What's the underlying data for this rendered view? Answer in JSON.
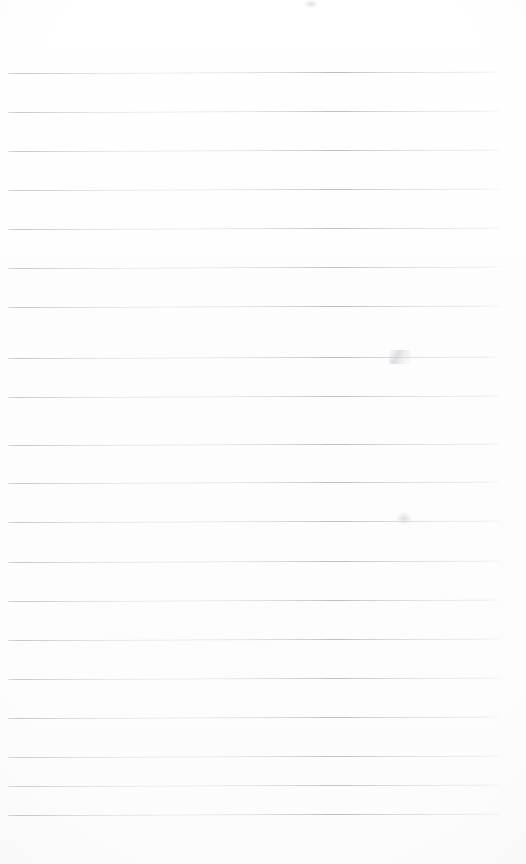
{
  "document": {
    "kind": "lined-notepad-page",
    "title": "Blank ruled notebook page",
    "page_width": 526,
    "page_height": 864,
    "background_color": "#fdfdfd",
    "content_text": "",
    "has_handwriting": false,
    "has_printed_text": false
  },
  "ruling": {
    "line_color": "#b9bbbe",
    "line_thickness_px": 1,
    "line_count": 20,
    "line_spacing_px": 39,
    "first_line_y": 73,
    "last_line_y": 815,
    "left_margin_x": 8,
    "right_margin_x": 500,
    "line_width_px": 492,
    "skew_degrees": -0.18,
    "lines": [
      {
        "index": 1,
        "y": 73,
        "x1": 8,
        "x2": 500,
        "opacity": 0.95
      },
      {
        "index": 2,
        "y": 112,
        "x1": 8,
        "x2": 500,
        "opacity": 0.9
      },
      {
        "index": 3,
        "y": 151,
        "x1": 8,
        "x2": 500,
        "opacity": 0.92
      },
      {
        "index": 4,
        "y": 190,
        "x1": 8,
        "x2": 500,
        "opacity": 0.88
      },
      {
        "index": 5,
        "y": 229,
        "x1": 8,
        "x2": 500,
        "opacity": 0.93
      },
      {
        "index": 6,
        "y": 268,
        "x1": 8,
        "x2": 500,
        "opacity": 0.9
      },
      {
        "index": 7,
        "y": 307,
        "x1": 8,
        "x2": 500,
        "opacity": 0.95
      },
      {
        "index": 8,
        "y": 358,
        "x1": 8,
        "x2": 500,
        "opacity": 0.92
      },
      {
        "index": 9,
        "y": 397,
        "x1": 8,
        "x2": 500,
        "opacity": 0.88
      },
      {
        "index": 10,
        "y": 445,
        "x1": 8,
        "x2": 500,
        "opacity": 0.94
      },
      {
        "index": 11,
        "y": 483,
        "x1": 8,
        "x2": 500,
        "opacity": 0.91
      },
      {
        "index": 12,
        "y": 522,
        "x1": 8,
        "x2": 500,
        "opacity": 0.89
      },
      {
        "index": 13,
        "y": 562,
        "x1": 8,
        "x2": 500,
        "opacity": 0.93
      },
      {
        "index": 14,
        "y": 601,
        "x1": 8,
        "x2": 500,
        "opacity": 0.9
      },
      {
        "index": 15,
        "y": 640,
        "x1": 8,
        "x2": 500,
        "opacity": 0.92
      },
      {
        "index": 16,
        "y": 679,
        "x1": 8,
        "x2": 500,
        "opacity": 0.88
      },
      {
        "index": 17,
        "y": 718,
        "x1": 8,
        "x2": 500,
        "opacity": 0.91
      },
      {
        "index": 18,
        "y": 757,
        "x1": 8,
        "x2": 500,
        "opacity": 0.86
      },
      {
        "index": 19,
        "y": 786,
        "x1": 8,
        "x2": 500,
        "opacity": 0.84
      },
      {
        "index": 20,
        "y": 815,
        "x1": 8,
        "x2": 500,
        "opacity": 0.95
      }
    ]
  },
  "marks": [
    {
      "name": "pencil-smudge-upper",
      "x": 389,
      "y": 350,
      "width": 22,
      "height": 14,
      "type": "stroke"
    },
    {
      "name": "pencil-smudge-lower",
      "x": 396,
      "y": 512,
      "width": 16,
      "height": 13,
      "type": "blob"
    },
    {
      "name": "scan-speck-top",
      "x": 304,
      "y": 0,
      "width": 14,
      "height": 8,
      "type": "blob"
    }
  ]
}
